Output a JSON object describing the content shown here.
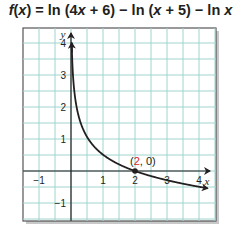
{
  "title": {
    "func": "f",
    "var": "x",
    "text": "f(x) = ln (4x + 6) − ln (x + 5) − ln x",
    "parts": {
      "a": "(",
      "b": ") = ln (4",
      "c": " + 6) − ln (",
      "d": " + 5) − ln "
    }
  },
  "colors": {
    "grid": "#9fd4cf",
    "grid_bg": "#ffffff",
    "axis": "#231f20",
    "curve": "#231f20",
    "frame": "#555555",
    "highlight": "#d9262b"
  },
  "chart_data": {
    "type": "line",
    "title": "f(x) = ln (4x + 6) − ln (x + 5) − ln x",
    "xlabel": "x",
    "ylabel": "y",
    "xlim": [
      -1.5,
      4.5
    ],
    "ylim": [
      -1.5,
      4.5
    ],
    "grid": true,
    "grid_step": 0.5,
    "x_ticks": [
      -1,
      1,
      2,
      3,
      4
    ],
    "y_ticks": [
      -1,
      1,
      2,
      3,
      4
    ],
    "x_tick_labels": [
      "−1",
      "1",
      "2",
      "3",
      "4"
    ],
    "y_tick_labels": [
      "−1",
      "1",
      "2",
      "3",
      "4"
    ],
    "series": [
      {
        "name": "f(x) = ln (4x + 6) − ln (x + 5) − ln x",
        "x": [
          0.02,
          0.05,
          0.1,
          0.2,
          0.3,
          0.5,
          0.75,
          1,
          1.5,
          2,
          2.5,
          3,
          3.5,
          4,
          4.5
        ],
        "y": [
          3.79,
          2.88,
          2.19,
          1.51,
          1.12,
          0.67,
          0.35,
          0.15,
          -0.07,
          0.0,
          -0.27,
          -0.38,
          -0.46,
          -0.53,
          -0.59
        ]
      }
    ],
    "annotations": [
      {
        "text": "(2, 0)",
        "x": 2,
        "y": 0,
        "highlight_value": "2"
      }
    ]
  },
  "labels": {
    "x_axis": "x",
    "y_axis": "y",
    "x_ticks": [
      "−1",
      "1",
      "2",
      "3",
      "4"
    ],
    "y_ticks": [
      "4",
      "3",
      "2",
      "1",
      "−1"
    ],
    "point": {
      "open": "(",
      "x": "2",
      "rest": ", 0)"
    }
  }
}
